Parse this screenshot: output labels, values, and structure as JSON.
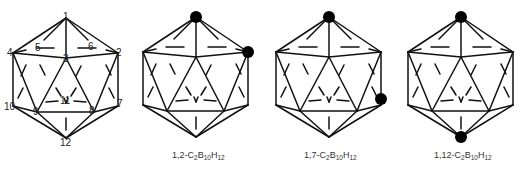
{
  "diagram": {
    "type": "icosahedral carborane structures",
    "panels": [
      {
        "id": "numbered-icosahedron",
        "vertex_labels": [
          "1",
          "2",
          "3",
          "4",
          "5",
          "6",
          "7",
          "8",
          "9",
          "10",
          "11",
          "12"
        ]
      },
      {
        "id": "ortho-carborane",
        "caption": {
          "prefix": "1,2-C",
          "c_sub": "2",
          "b": "B",
          "b_sub": "10",
          "h": "H",
          "h_sub": "12"
        },
        "carbon_positions": [
          1,
          2
        ]
      },
      {
        "id": "meta-carborane",
        "caption": {
          "prefix": "1,7-C",
          "c_sub": "2",
          "b": "B",
          "b_sub": "10",
          "h": "H",
          "h_sub": "12"
        },
        "carbon_positions": [
          1,
          7
        ]
      },
      {
        "id": "para-carborane",
        "caption": {
          "prefix": "1,12-C",
          "c_sub": "2",
          "b": "B",
          "b_sub": "10",
          "h": "H",
          "h_sub": "12"
        },
        "carbon_positions": [
          1,
          12
        ]
      }
    ],
    "colors": {
      "line": "#111111",
      "carbon_atom": "#000000",
      "background": "#ffffff"
    }
  }
}
